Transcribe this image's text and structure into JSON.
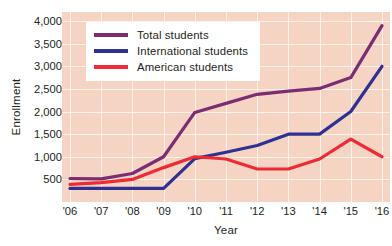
{
  "chart_data": {
    "type": "line",
    "title": "",
    "xlabel": "Year",
    "ylabel": "Enrollment",
    "categories": [
      "'06",
      "'07",
      "'08",
      "'09",
      "'10",
      "'11",
      "'12",
      "'13",
      "'14",
      "'15",
      "'16"
    ],
    "ylim": [
      0,
      4200
    ],
    "yticks": [
      500,
      1000,
      1500,
      2000,
      2500,
      3000,
      3500,
      4000
    ],
    "ytick_labels": [
      "500",
      "1,000",
      "1,500",
      "2,000",
      "2,500",
      "3,000",
      "3,500",
      "4,000"
    ],
    "grid": true,
    "legend_position": "top-left",
    "series": [
      {
        "name": "Total students",
        "color": "#7b2d73",
        "values": [
          520,
          510,
          630,
          1000,
          1980,
          2180,
          2380,
          2450,
          2510,
          2750,
          3900
        ]
      },
      {
        "name": "International students",
        "color": "#2e3192",
        "values": [
          300,
          300,
          300,
          300,
          960,
          1100,
          1250,
          1500,
          1500,
          2000,
          3000
        ]
      },
      {
        "name": "American students",
        "color": "#ee2b35",
        "values": [
          390,
          430,
          500,
          760,
          1000,
          950,
          730,
          730,
          950,
          1390,
          1000
        ]
      }
    ],
    "plot_background": "#f6d4c4",
    "gridline_color": "#fdf1ea"
  }
}
